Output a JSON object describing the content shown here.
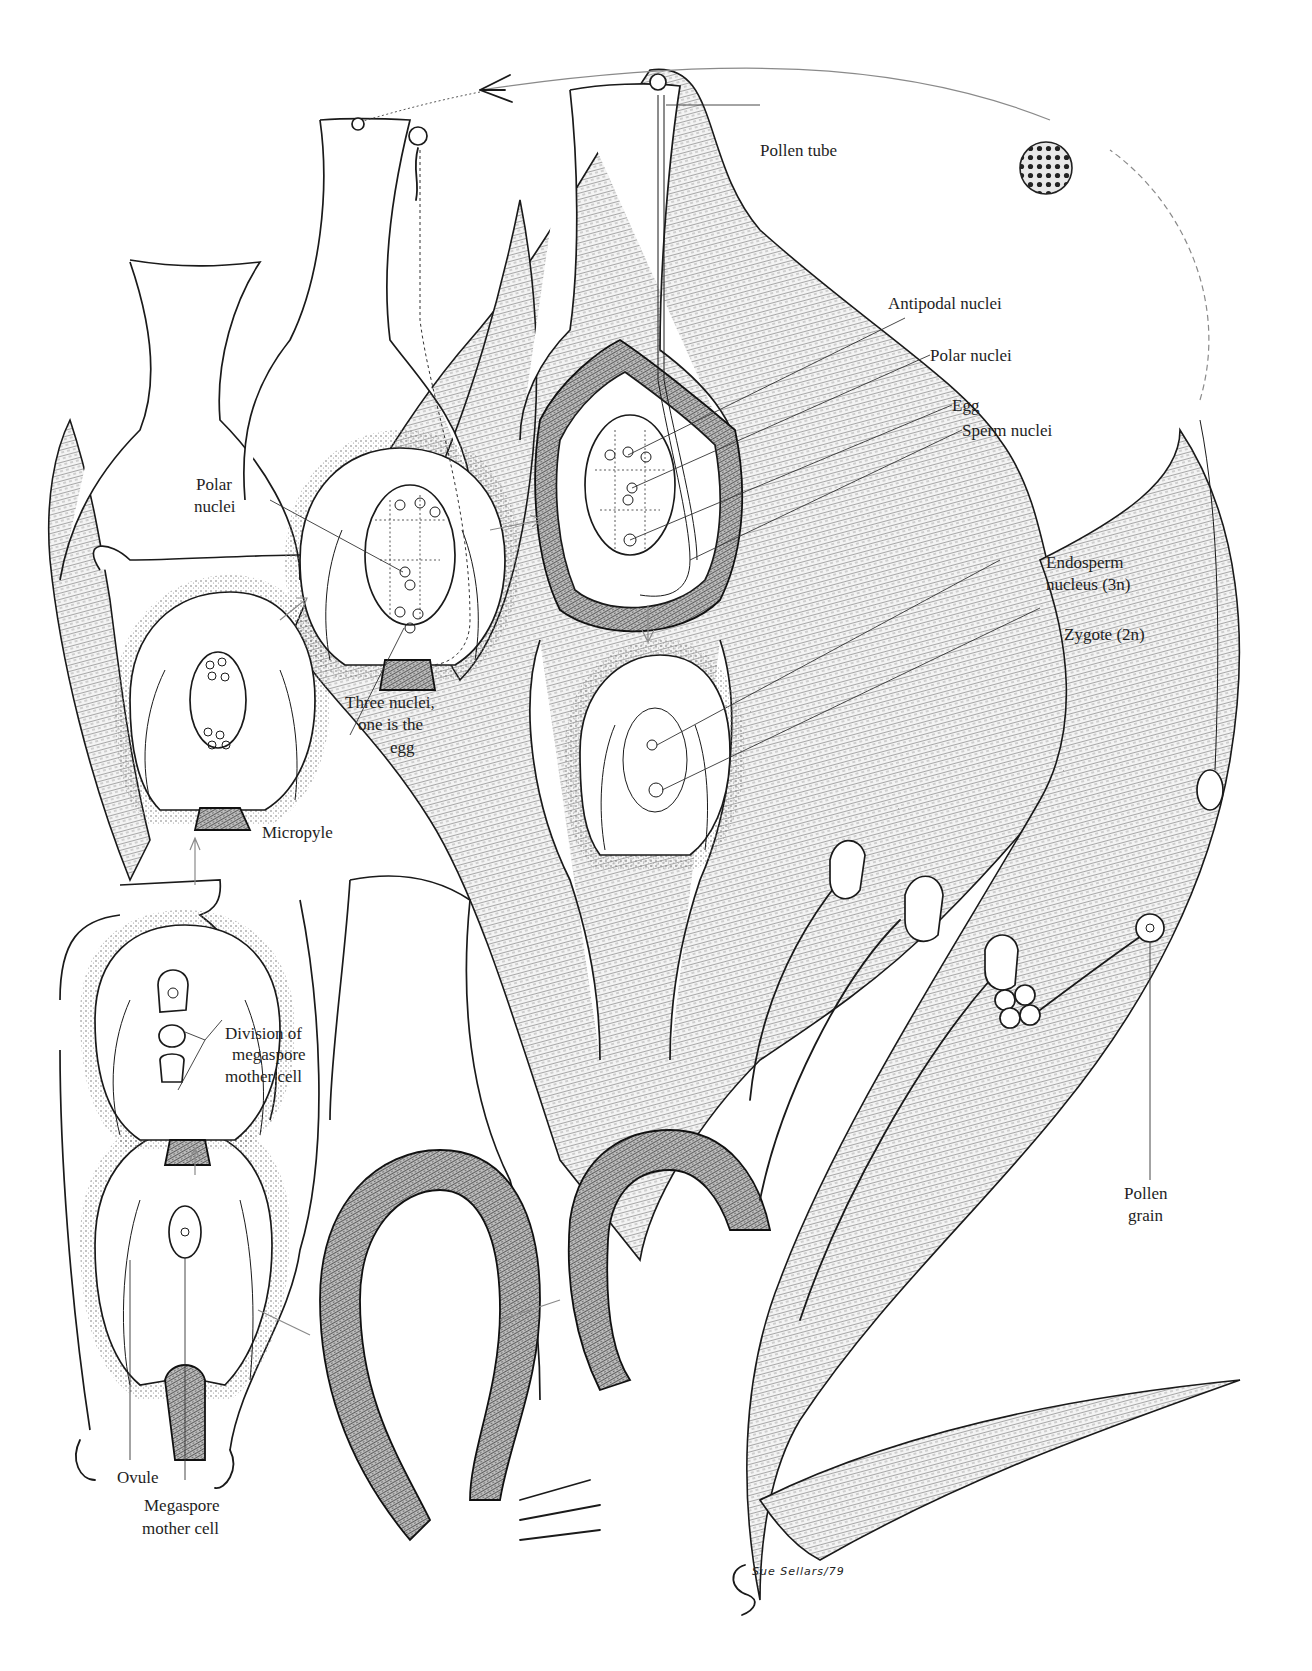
{
  "figure": {
    "signature": "Sue Sellars/79"
  },
  "labels": {
    "pollen_tube": "Pollen tube",
    "antipodal_nuclei": "Antipodal nuclei",
    "polar_nuclei_right": "Polar nuclei",
    "egg": "Egg",
    "sperm_nuclei": "Sperm nuclei",
    "endosperm_line1": "Endosperm",
    "endosperm_line2": "nucleus (3n)",
    "zygote": "Zygote (2n)",
    "polar_nuclei_left_line1": "Polar",
    "polar_nuclei_left_line2": "nuclei",
    "three_nuclei_line1": "Three nuclei,",
    "three_nuclei_line2": "one is the",
    "three_nuclei_line3": "egg",
    "micropyle": "Micropyle",
    "division_line1": "Division of",
    "division_line2": "megaspore",
    "division_line3": "mother cell",
    "ovule": "Ovule",
    "megaspore_line1": "Megaspore",
    "megaspore_line2": "mother cell",
    "pollen_grain_line1": "Pollen",
    "pollen_grain_line2": "grain"
  },
  "stages": [
    {
      "id": "stage-1",
      "name": "Ovule with megaspore mother cell"
    },
    {
      "id": "stage-2",
      "name": "Division of megaspore mother cell"
    },
    {
      "id": "stage-3",
      "name": "Eight-nucleate embryo sac"
    },
    {
      "id": "stage-4",
      "name": "Mature embryo sac with polar nuclei and egg"
    },
    {
      "id": "stage-5",
      "name": "Pollen tube entering micropyle"
    },
    {
      "id": "stage-6",
      "name": "Double fertilization: endosperm nucleus and zygote"
    },
    {
      "id": "stage-7",
      "name": "Stamens releasing pollen grains"
    },
    {
      "id": "stage-8",
      "name": "Airborne pollen grain"
    }
  ],
  "colors": {
    "ink": "#1a1a1a",
    "paper": "#ffffff",
    "arrow_gray": "#8a8a8a"
  }
}
